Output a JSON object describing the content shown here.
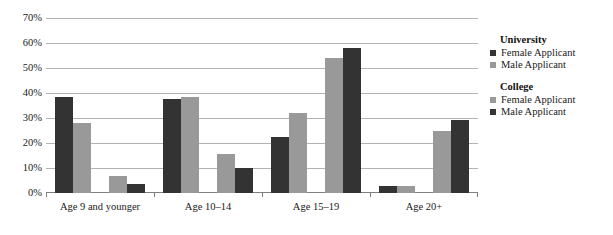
{
  "chart_data": {
    "type": "bar",
    "title": "",
    "subtitle": "",
    "xlabel": "",
    "ylabel": "",
    "ylim": [
      0,
      70
    ],
    "ytick_labels": [
      "0%",
      "10%",
      "20%",
      "30%",
      "40%",
      "50%",
      "60%",
      "70%"
    ],
    "ytick_values": [
      0,
      10,
      20,
      30,
      40,
      50,
      60,
      70
    ],
    "grid": true,
    "legend_position": "right",
    "categories": [
      "Age 9 and younger",
      "Age 10–14",
      "Age 15–19",
      "Age 20+"
    ],
    "series": [
      {
        "name": "University Female Applicant",
        "group": "University",
        "label": "Female Applicant",
        "color": "#333333",
        "values": [
          38.5,
          38.0,
          22.5,
          3.0
        ]
      },
      {
        "name": "University Male Applicant",
        "group": "University",
        "label": "Male Applicant",
        "color": "#999999",
        "values": [
          28.0,
          38.5,
          32.0,
          3.0
        ]
      },
      {
        "name": "College Female Applicant",
        "group": "College",
        "label": "Female Applicant",
        "color": "#999999",
        "values": [
          7.0,
          15.5,
          54.5,
          25.0
        ]
      },
      {
        "name": "College Male Applicant",
        "group": "College",
        "label": "Male Applicant",
        "color": "#333333",
        "values": [
          3.5,
          10.0,
          58.5,
          29.5
        ]
      }
    ]
  },
  "legend": {
    "blocks": [
      {
        "title": "University",
        "entries": [
          {
            "label": "Female Applicant",
            "color": "#333333"
          },
          {
            "label": "Male Applicant",
            "color": "#999999"
          }
        ]
      },
      {
        "title": "College",
        "entries": [
          {
            "label": "Female Applicant",
            "color": "#999999"
          },
          {
            "label": "Male Applicant",
            "color": "#333333"
          }
        ]
      }
    ]
  }
}
